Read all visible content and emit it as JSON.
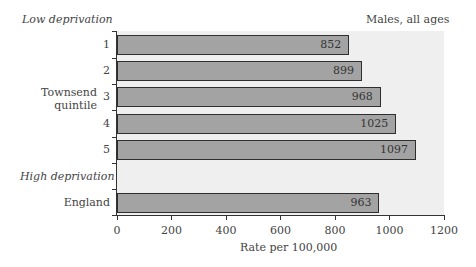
{
  "chart_data": {
    "type": "bar",
    "orientation": "horizontal",
    "title": "Males, all ages",
    "xlabel": "Rate per 100,000",
    "ylabel": "Townsend quintile",
    "xlim": [
      0,
      1200
    ],
    "xticks": [
      0,
      200,
      400,
      600,
      800,
      1000,
      1200
    ],
    "categories": [
      "1",
      "2",
      "3",
      "4",
      "5",
      "England"
    ],
    "values": [
      852,
      899,
      968,
      1025,
      1097,
      963
    ],
    "annotations": {
      "top_left": "Low deprivation",
      "middle_left": "High deprivation"
    },
    "grid": false,
    "legend": null
  },
  "labels": {
    "title": "Males, all ages",
    "low": "Low deprivation",
    "high": "High deprivation",
    "group_line1": "Townsend",
    "group_line2": "quintile",
    "xlabel": "Rate per 100,000"
  },
  "colors": {
    "bar_fill": "#a3a3a3",
    "bar_border": "#2e2e2e",
    "plot_bg": "#efefef"
  }
}
